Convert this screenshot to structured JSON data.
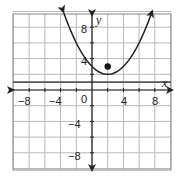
{
  "chart_data": {
    "type": "line",
    "title": "",
    "xlabel": "x",
    "ylabel": "y",
    "xlim": [
      -10,
      10
    ],
    "ylim": [
      -10,
      10
    ],
    "grid": true,
    "grid_step": 2,
    "x_ticks": [
      "-8",
      "-4",
      "0",
      "4",
      "8"
    ],
    "y_ticks": [
      "8",
      "4",
      "-4",
      "-8"
    ],
    "series": [
      {
        "name": "parabola",
        "equation": "y = (x - 2)^2 / 4 + 2",
        "vertex": [
          2,
          2
        ],
        "x_range": [
          -3.66,
          7.66
        ],
        "arrows": true
      },
      {
        "name": "directrix",
        "equation": "y = 1",
        "type": "horizontal-line"
      },
      {
        "name": "focus",
        "type": "point",
        "x": 2,
        "y": 3
      }
    ]
  },
  "labels": {
    "x_axis": "x",
    "y_axis": "y",
    "origin": "0",
    "x_neg8": "−8",
    "x_neg4": "−4",
    "x_4": "4",
    "x_8": "8",
    "y_8": "8",
    "y_4": "4",
    "y_neg4": "−4",
    "y_neg8": "−8"
  },
  "colors": {
    "grid": "#b8b8b8",
    "axis": "#222222",
    "curve": "#222222",
    "directrix": "#555555"
  }
}
